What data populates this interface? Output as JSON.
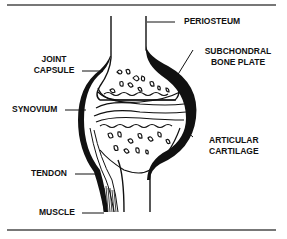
{
  "diagram": {
    "type": "anatomical cross-section",
    "colors": {
      "ink": "#111111",
      "rule": "#777777",
      "background": "#ffffff"
    }
  },
  "labels": {
    "periosteum": "PERIOSTEUM",
    "joint_capsule": [
      "JOINT",
      "CAPSULE"
    ],
    "subchondral_bone_plate": [
      "SUBCHONDRAL",
      "BONE PLATE"
    ],
    "synovium": "SYNOVIUM",
    "articular_cartilage": [
      "ARTICULAR",
      "CARTILAGE"
    ],
    "tendon": "TENDON",
    "muscle": "MUSCLE"
  }
}
